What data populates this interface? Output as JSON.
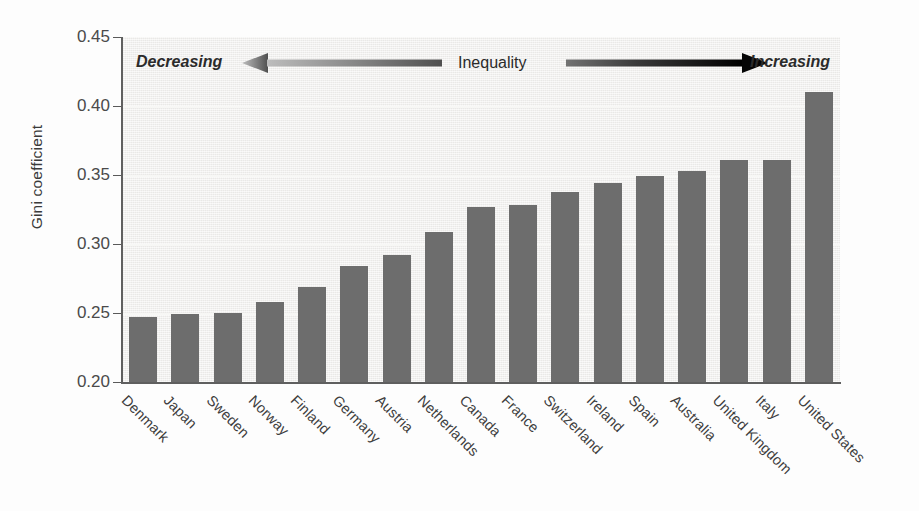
{
  "chart_data": {
    "type": "bar",
    "title": "",
    "subtitle": "",
    "xlabel": "",
    "ylabel": "Gini coefficient",
    "ylim": [
      0.2,
      0.45
    ],
    "ytick_labels": [
      "0.45",
      "0.40",
      "0.35",
      "0.30",
      "0.25",
      "0.20"
    ],
    "ytick_values": [
      0.45,
      0.4,
      0.35,
      0.3,
      0.25,
      0.2
    ],
    "grid": true,
    "grid_axis": "y",
    "legend": "none",
    "bar_color": "#6d6d6d",
    "plot_background": "#eeedeb",
    "categories": [
      "Denmark",
      "Japan",
      "Sweden",
      "Norway",
      "Finland",
      "Germany",
      "Austria",
      "Netherlands",
      "Canada",
      "France",
      "Switzerland",
      "Ireland",
      "Spain",
      "Australia",
      "United Kingdom",
      "Italy",
      "United States"
    ],
    "values": [
      0.247,
      0.249,
      0.25,
      0.258,
      0.269,
      0.284,
      0.292,
      0.309,
      0.327,
      0.328,
      0.338,
      0.344,
      0.349,
      0.353,
      0.361,
      0.361,
      0.41
    ],
    "annotations": {
      "left_label": "Decreasing",
      "center_label": "Inequality",
      "right_label": "Increasing",
      "left_arrow": "arrow-left-gradient",
      "right_arrow": "arrow-right-gradient",
      "left_arrow_color_tip": "#b6b6b6",
      "left_arrow_color_tail": "#5a5a5a",
      "right_arrow_color_tail": "#6a6a6a",
      "right_arrow_color_tip": "#000000"
    }
  }
}
